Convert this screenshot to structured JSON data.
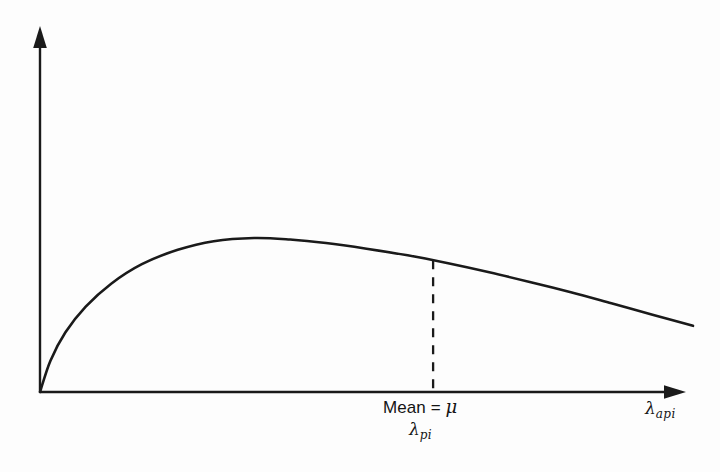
{
  "figure": {
    "background_color": "#fdfdfd",
    "ink_color": "#1a1a1a"
  },
  "labels": {
    "mean_prefix": "Mean = ",
    "mean_symbol": "μ",
    "mean_sub_lambda": "λ",
    "mean_sub_script": "pi",
    "x_axis_lambda": "λ",
    "x_axis_script": "api"
  },
  "chart_data": {
    "type": "line",
    "title": "",
    "subtitle": "",
    "xlabel": "λ_api",
    "ylabel": "",
    "grid": false,
    "legend": null,
    "axes": {
      "x_arrow": true,
      "y_arrow": true,
      "x_ticks": [],
      "y_ticks": [],
      "xlim": [
        0,
        1
      ],
      "ylim": [
        0,
        1
      ]
    },
    "annotations": [
      {
        "name": "mean-marker",
        "text": "Mean = μ",
        "secondary_text": "λ_pi",
        "x": 0.602,
        "style": "vertical-dashed-line"
      }
    ],
    "series": [
      {
        "name": "probability-density-curve",
        "description": "Right-skewed unimodal density rising steeply from origin to a peak then decaying",
        "x": [
          0.0,
          0.016,
          0.039,
          0.07,
          0.109,
          0.156,
          0.211,
          0.266,
          0.328,
          0.383,
          0.438,
          0.5,
          0.563,
          0.625,
          0.688,
          0.75,
          0.813,
          0.875,
          0.938,
          1.0
        ],
        "y": [
          0.0,
          0.188,
          0.358,
          0.512,
          0.65,
          0.767,
          0.853,
          0.905,
          0.924,
          0.915,
          0.894,
          0.86,
          0.82,
          0.772,
          0.718,
          0.66,
          0.598,
          0.532,
          0.464,
          0.397
        ]
      }
    ]
  }
}
